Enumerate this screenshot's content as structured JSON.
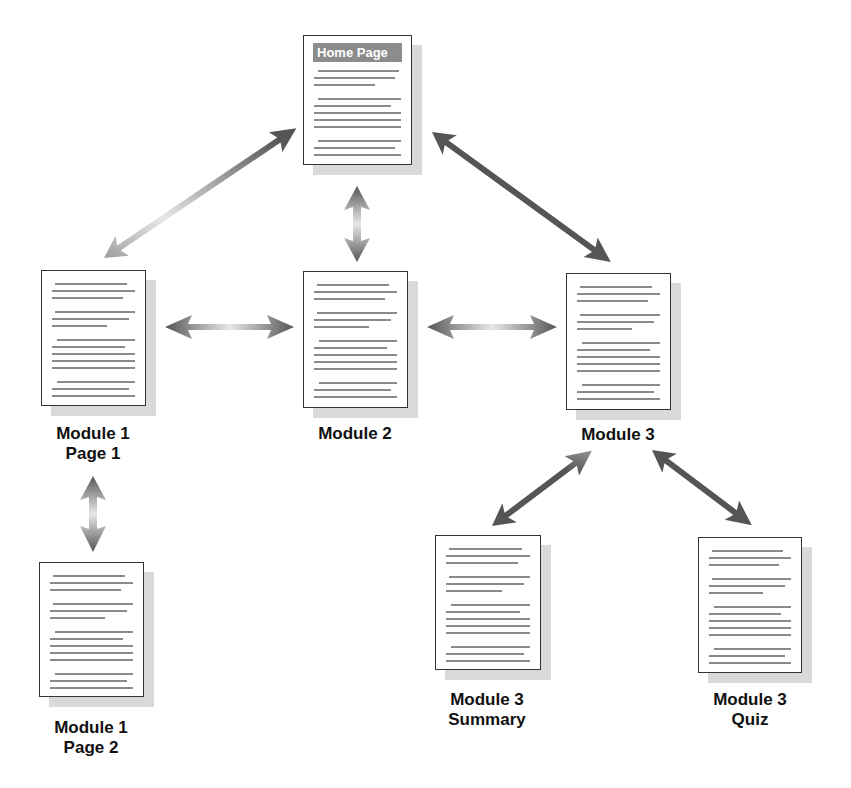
{
  "diagram": {
    "type": "site-structure",
    "nodes": [
      {
        "id": "home",
        "label": "Home Page",
        "title_in_doc": "Home Page",
        "x": 303,
        "y": 35,
        "w": 109,
        "h": 130
      },
      {
        "id": "m1p1",
        "label_line1": "Module 1",
        "label_line2": "Page 1",
        "x": 41,
        "y": 270,
        "w": 105,
        "h": 136
      },
      {
        "id": "m2",
        "label_line1": "Module 2",
        "x": 303,
        "y": 271,
        "w": 105,
        "h": 137
      },
      {
        "id": "m3",
        "label_line1": "Module 3",
        "x": 566,
        "y": 273,
        "w": 105,
        "h": 137
      },
      {
        "id": "m1p2",
        "label_line1": "Module 1",
        "label_line2": "Page 2",
        "x": 39,
        "y": 562,
        "w": 105,
        "h": 135
      },
      {
        "id": "m3s",
        "label_line1": "Module 3",
        "label_line2": "Summary",
        "x": 435,
        "y": 535,
        "w": 106,
        "h": 135
      },
      {
        "id": "m3q",
        "label_line1": "Module 3",
        "label_line2": "Quiz",
        "x": 698,
        "y": 537,
        "w": 104,
        "h": 136
      }
    ],
    "edges": [
      {
        "from": "home",
        "to": "m1p1",
        "bidirectional": true
      },
      {
        "from": "home",
        "to": "m2",
        "bidirectional": true
      },
      {
        "from": "home",
        "to": "m3",
        "bidirectional": true
      },
      {
        "from": "m1p1",
        "to": "m2",
        "bidirectional": true
      },
      {
        "from": "m2",
        "to": "m3",
        "bidirectional": true
      },
      {
        "from": "m1p1",
        "to": "m1p2",
        "bidirectional": true
      },
      {
        "from": "m3",
        "to": "m3s",
        "bidirectional": true
      },
      {
        "from": "m3",
        "to": "m3q",
        "bidirectional": true
      }
    ],
    "colors": {
      "arrow_dark": "#555555",
      "arrow_light": "#e6e6e6",
      "doc_border": "#333333",
      "doc_shadow": "#d9d9d9",
      "text_line": "#8a8a8a",
      "title_bar": "#8c8c8c"
    }
  }
}
